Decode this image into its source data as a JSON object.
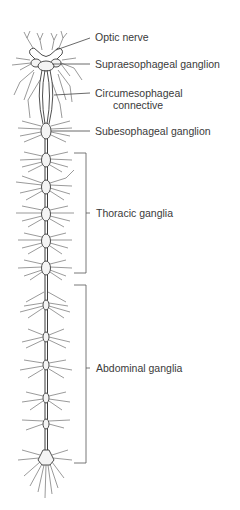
{
  "figure": {
    "type": "anatomical-diagram",
    "colors": {
      "line": "#3c3c3c",
      "ganglion_fill": "#f4f4f4",
      "background": "#ffffff",
      "text": "#3a3a3a"
    }
  },
  "labels": {
    "optic_nerve": "Optic nerve",
    "supraesophageal_ganglion": "Supraesophageal ganglion",
    "circumesophageal_line1": "Circumesophageal",
    "circumesophageal_line2": "connective",
    "subesophageal_ganglion": "Subesophageal ganglion",
    "thoracic_ganglia": "Thoracic ganglia",
    "abdominal_ganglia": "Abdominal ganglia"
  },
  "structure": {
    "cord_center_x": 46,
    "ganglia_y": {
      "subesophageal": 131,
      "thoracic": [
        160,
        187,
        214,
        241,
        268
      ],
      "abdominal": [
        305,
        337,
        365,
        398,
        424
      ],
      "terminal": 460
    },
    "brackets": {
      "thoracic": {
        "top": 153,
        "bottom": 273
      },
      "abdominal": {
        "top": 285,
        "bottom": 463
      }
    }
  }
}
